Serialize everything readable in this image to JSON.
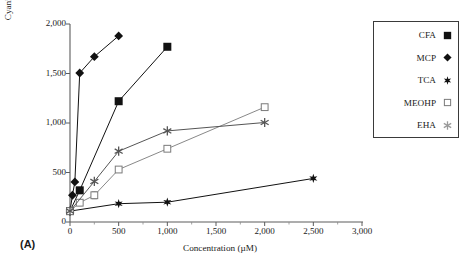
{
  "figure": {
    "panel_label": "(A)",
    "background_color": "#ffffff",
    "ink_color": "#1a1a1a",
    "light_ink_color": "#8a8a8a"
  },
  "legend": {
    "position": "right",
    "entries": [
      {
        "label": "CFA",
        "marker": "filled-square-icon",
        "color": "#111111"
      },
      {
        "label": "MCP",
        "marker": "filled-diamond-icon",
        "color": "#111111"
      },
      {
        "label": "TCA",
        "marker": "filled-star-icon",
        "color": "#111111"
      },
      {
        "label": "MEOHP",
        "marker": "open-square-icon",
        "color": "#7a7a7a"
      },
      {
        "label": "EHA",
        "marker": "asterisk-icon",
        "color": "#9a9a9a"
      }
    ]
  },
  "axes": {
    "x_tick_labels": [
      "0",
      "500",
      "1,000",
      "1,500",
      "2,000",
      "2,500",
      "3,000"
    ],
    "y_tick_labels": [
      "0",
      "500",
      "1,000",
      "1,500",
      "2,000"
    ]
  },
  "chart_data": {
    "type": "line",
    "title": "",
    "subtitle": "",
    "xlabel": "Concentration (µM)",
    "ylabel": "Cyanide-insensitive palmitoyl CoA oxidation (% control)",
    "xlim": [
      0,
      3000
    ],
    "ylim": [
      0,
      2000
    ],
    "x_ticks": [
      0,
      500,
      1000,
      1500,
      2000,
      2500,
      3000
    ],
    "y_ticks": [
      0,
      500,
      1000,
      1500,
      2000
    ],
    "grid": false,
    "legend_position": "upper right outside",
    "annotations": [
      "(A)"
    ],
    "series": [
      {
        "name": "CFA",
        "marker": "filled-square",
        "color": "#111111",
        "x": [
          0,
          100,
          500,
          1000
        ],
        "y": [
          110,
          320,
          1220,
          1770
        ]
      },
      {
        "name": "MCP",
        "marker": "filled-diamond",
        "color": "#111111",
        "x": [
          0,
          25,
          50,
          100,
          250,
          500
        ],
        "y": [
          110,
          270,
          405,
          1505,
          1670,
          1880
        ]
      },
      {
        "name": "TCA",
        "marker": "filled-star",
        "color": "#111111",
        "x": [
          0,
          500,
          1000,
          2500
        ],
        "y": [
          110,
          185,
          200,
          440
        ]
      },
      {
        "name": "MEOHP",
        "marker": "open-square",
        "color": "#7a7a7a",
        "x": [
          0,
          100,
          250,
          500,
          1000,
          2000
        ],
        "y": [
          110,
          195,
          270,
          530,
          740,
          1160
        ],
        "yerr": [
          0,
          30,
          35,
          0,
          0,
          0
        ]
      },
      {
        "name": "EHA",
        "marker": "asterisk",
        "color": "#555555",
        "x": [
          0,
          250,
          500,
          1000,
          2000
        ],
        "y": [
          110,
          410,
          715,
          920,
          1005
        ]
      }
    ]
  }
}
